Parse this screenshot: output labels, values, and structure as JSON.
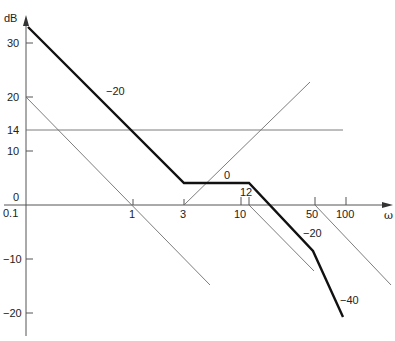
{
  "diagram": {
    "type": "bode-magnitude-asymptotic-plot",
    "y_axis": {
      "label": "dB",
      "ticks": [
        {
          "value": "30",
          "y": 43
        },
        {
          "value": "20",
          "y": 97
        },
        {
          "value": "14",
          "y": 130
        },
        {
          "value": "10",
          "y": 151
        },
        {
          "value": "0",
          "y": 205
        },
        {
          "value": "−10",
          "y": 259
        },
        {
          "value": "−20",
          "y": 313
        }
      ]
    },
    "x_axis": {
      "label": "ω",
      "scale": "log",
      "ticks": [
        {
          "value": "0.1",
          "x": 26
        },
        {
          "value": "1",
          "x": 133
        },
        {
          "value": "3",
          "x": 184
        },
        {
          "value": "10",
          "x": 241
        },
        {
          "value": "12",
          "x": 249
        },
        {
          "value": "50",
          "x": 315
        },
        {
          "value": "100",
          "x": 346
        }
      ]
    },
    "slope_labels": [
      {
        "text": "−20",
        "x": 106,
        "y": 95
      },
      {
        "text": "0",
        "x": 225,
        "y": 179
      },
      {
        "text": "−20",
        "x": 304,
        "y": 237
      },
      {
        "text": "−40",
        "x": 340,
        "y": 304
      }
    ],
    "thick_curve": {
      "name": "composite-asymptote",
      "points_omega_db": [
        [
          0.1,
          33
        ],
        [
          3,
          4
        ],
        [
          12,
          4
        ],
        [
          50,
          -8.5
        ],
        [
          100,
          -20.5
        ]
      ]
    },
    "thin_lines": [
      {
        "name": "integrator-line",
        "from": [
          0.1,
          20
        ],
        "to": "passes 0 dB at ω=1"
      },
      {
        "name": "gain-14dB",
        "value_db": 14
      },
      {
        "name": "zero-at-3",
        "from": [
          3,
          0
        ],
        "slope": "+20"
      },
      {
        "name": "pole-at-12",
        "from": [
          12,
          0
        ],
        "slope": "−20"
      },
      {
        "name": "pole-at-50",
        "from": [
          50,
          0
        ],
        "slope": "−20"
      }
    ]
  },
  "colors": {
    "thick_line": "#111111",
    "thin_line": "#6e6e6e",
    "axis": "#555555",
    "background": "#ffffff"
  }
}
